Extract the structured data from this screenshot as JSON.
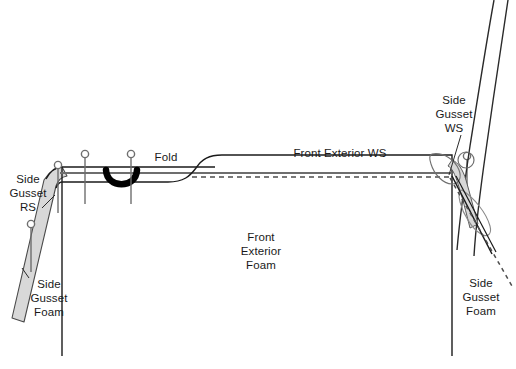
{
  "diagram": {
    "type": "technical-line-diagram",
    "canvas": {
      "width": 516,
      "height": 369,
      "background": "#ffffff"
    },
    "colors": {
      "outline": "#1a1a1a",
      "seam_line": "#6e6e6e",
      "gusset_fill": "#d6d6d6",
      "gusset_stroke": "#555555",
      "fold_mark": "#000000",
      "pin_stroke": "#6e6e6e",
      "dashed": "#555555",
      "text": "#1a1a1a"
    },
    "labels": {
      "side_gusset_rs": "Side\nGusset\nRS",
      "side_gusset_foam_left": "Side\nGusset\nFoam",
      "fold": "Fold",
      "front_exterior_ws": "Front Exterior WS",
      "front_exterior_foam": "Front\nExterior\nFoam",
      "side_gusset_ws": "Side\nGusset\nWS",
      "side_gusset_foam_right": "Side\nGusset\nFoam"
    },
    "features": {
      "pin_count": 5,
      "fold_marker": "thick-u-curve",
      "dashed_seam_allowance": true,
      "gusset_panel_shading": "gray"
    }
  }
}
